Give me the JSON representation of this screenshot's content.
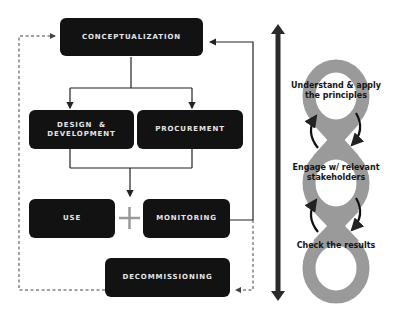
{
  "flowchart": {
    "boxes": {
      "conceptualization": "CONCEPTUALIZATION",
      "design_development_line1": "DESIGN  &",
      "design_development_line2": "DEVELOPMENT",
      "procurement": "PROCUREMENT",
      "use": "USE",
      "monitoring": "MONITORING",
      "decommissioning": "DECOMMISSIONING"
    },
    "connector_symbol": "+"
  },
  "cycle": {
    "steps": [
      {
        "line1": "Understand & apply",
        "line2": "the principles"
      },
      {
        "line1": "Engage w/ relevant",
        "line2": "stakeholders"
      },
      {
        "line1": "Check the results",
        "line2": ""
      }
    ]
  },
  "colors": {
    "box_fill": "#121212",
    "box_text": "#e6e6e6",
    "ring_gray": "#9a9a9a",
    "arrow_dark": "#222222",
    "plus_gray": "#9a9a9a"
  }
}
